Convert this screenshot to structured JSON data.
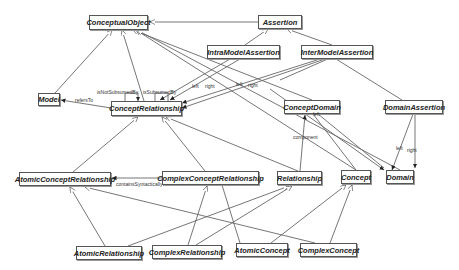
{
  "diagram": {
    "nodes": [
      {
        "id": "ConceptualObject",
        "label": "ConceptualObject",
        "x": 89,
        "y": 15,
        "w": 59,
        "h": 15
      },
      {
        "id": "Assertion",
        "label": "Assertion",
        "x": 258,
        "y": 15,
        "w": 44,
        "h": 14
      },
      {
        "id": "IntraModelAssertion",
        "label": "IntraModelAssertion",
        "x": 207,
        "y": 45,
        "w": 73,
        "h": 14
      },
      {
        "id": "InterModelAssertion",
        "label": "InterModelAssertion",
        "x": 301,
        "y": 45,
        "w": 72,
        "h": 14
      },
      {
        "id": "Model",
        "label": "Model",
        "x": 38,
        "y": 93,
        "w": 22,
        "h": 13
      },
      {
        "id": "ConceptRelationship",
        "label": "ConceptRelationship",
        "x": 111,
        "y": 101,
        "w": 71,
        "h": 15
      },
      {
        "id": "ConceptDomain",
        "label": "ConceptDomain",
        "x": 284,
        "y": 100,
        "w": 56,
        "h": 14
      },
      {
        "id": "DomainAssertion",
        "label": "DomainAssertion",
        "x": 385,
        "y": 100,
        "w": 58,
        "h": 14
      },
      {
        "id": "AtomicConceptRelationship",
        "label": "AtomicConceptRelationship",
        "x": 19,
        "y": 172,
        "w": 92,
        "h": 14
      },
      {
        "id": "ComplexConceptRelationship",
        "label": "ComplexConceptRelationship",
        "x": 162,
        "y": 171,
        "w": 97,
        "h": 14
      },
      {
        "id": "Relationship",
        "label": "Relationship",
        "x": 277,
        "y": 171,
        "w": 45,
        "h": 14
      },
      {
        "id": "Concept",
        "label": "Concept",
        "x": 341,
        "y": 170,
        "w": 30,
        "h": 14
      },
      {
        "id": "Domain",
        "label": "Domain",
        "x": 386,
        "y": 170,
        "w": 28,
        "h": 14
      },
      {
        "id": "AtomicRelationship",
        "label": "AtomicRelationship",
        "x": 76,
        "y": 246,
        "w": 66,
        "h": 14
      },
      {
        "id": "ComplexRelationship",
        "label": "ComplexRelationship",
        "x": 152,
        "y": 245,
        "w": 70,
        "h": 14
      },
      {
        "id": "AtomicConcept",
        "label": "AtomicConcept",
        "x": 236,
        "y": 243,
        "w": 52,
        "h": 14
      },
      {
        "id": "ComplexConcept",
        "label": "ComplexConcept",
        "x": 300,
        "y": 243,
        "w": 57,
        "h": 14
      }
    ],
    "edge_labels": [
      {
        "text": "refersTo",
        "x": 75,
        "y": 97
      },
      {
        "text": "isNotSubsumedBy",
        "x": 97,
        "y": 89
      },
      {
        "text": "isSubsumedBy",
        "x": 143,
        "y": 89
      },
      {
        "text": "left",
        "x": 192,
        "y": 83
      },
      {
        "text": "right",
        "x": 205,
        "y": 83
      },
      {
        "text": "left",
        "x": 236,
        "y": 81
      },
      {
        "text": "right",
        "x": 248,
        "y": 82
      },
      {
        "text": "left",
        "x": 313,
        "y": 111
      },
      {
        "text": "component",
        "x": 293,
        "y": 134
      },
      {
        "text": "left",
        "x": 396,
        "y": 145
      },
      {
        "text": "right",
        "x": 407,
        "y": 147
      },
      {
        "text": "containsSyntactically",
        "x": 116,
        "y": 181
      }
    ]
  }
}
